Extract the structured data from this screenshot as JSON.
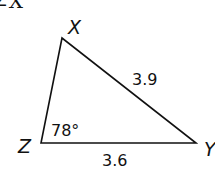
{
  "header": {
    "partial_label": "∠X"
  },
  "triangle": {
    "vertices": {
      "X": "X",
      "Y": "Y",
      "Z": "Z"
    },
    "angle_Z": "78°",
    "side_XY": "3.9",
    "side_ZY": "3.6"
  },
  "colors": {
    "stroke": "#111111",
    "background": "#ffffff"
  }
}
